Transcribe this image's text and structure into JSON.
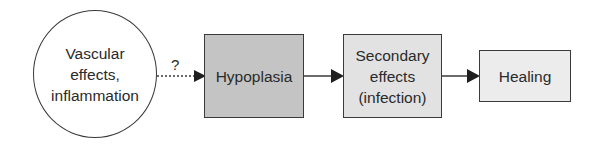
{
  "diagram": {
    "nodes": [
      {
        "id": "vascular",
        "label": "Vascular\neffects,\ninflammation",
        "shape": "circle",
        "fill": "#ffffff"
      },
      {
        "id": "hypoplasia",
        "label": "Hypoplasia",
        "shape": "box",
        "fill": "#c4c4c4"
      },
      {
        "id": "secondary",
        "label": "Secondary\neffects\n(infection)",
        "shape": "box",
        "fill": "#e2e2e2"
      },
      {
        "id": "healing",
        "label": "Healing",
        "shape": "box",
        "fill": "#ececec"
      }
    ],
    "edges": [
      {
        "from": "vascular",
        "to": "hypoplasia",
        "style": "dotted",
        "label": "?"
      },
      {
        "from": "hypoplasia",
        "to": "secondary",
        "style": "solid"
      },
      {
        "from": "secondary",
        "to": "healing",
        "style": "solid"
      }
    ]
  }
}
